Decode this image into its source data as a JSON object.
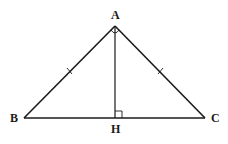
{
  "diagram": {
    "type": "isosceles-right-triangle-with-altitude",
    "points": {
      "A": {
        "label": "A",
        "x": 115,
        "y": 26
      },
      "B": {
        "label": "B",
        "x": 24,
        "y": 118
      },
      "C": {
        "label": "C",
        "x": 205,
        "y": 118
      },
      "H": {
        "label": "H",
        "x": 115,
        "y": 118
      }
    },
    "segments": [
      "AB",
      "AC",
      "BC",
      "AH"
    ],
    "markers": {
      "right_angle_at_H": true,
      "right_angle_at_A": true,
      "equal_tick_AB": true,
      "equal_tick_AC": true
    },
    "colors": {
      "stroke": "#1a1a1a",
      "background": "#ffffff"
    }
  }
}
